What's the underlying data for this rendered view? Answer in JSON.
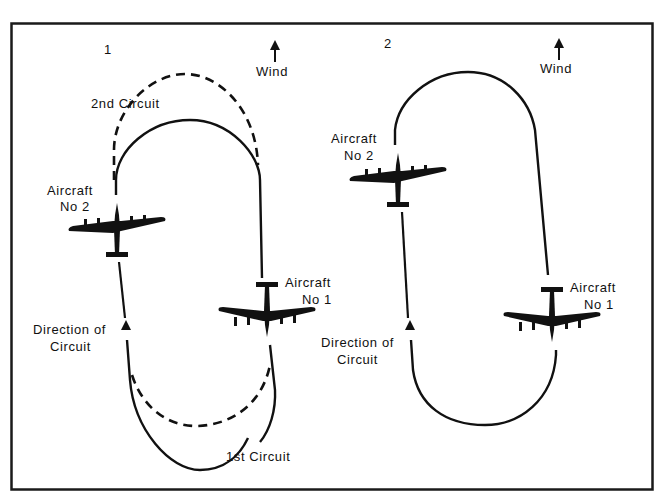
{
  "figure": {
    "border_color": "#1a1a1a",
    "ink_color": "#111111",
    "background": "#ffffff"
  },
  "panels": [
    {
      "number": "1",
      "wind_label": "Wind",
      "second_circuit_label": "2nd Circuit",
      "first_circuit_label": "1st Circuit",
      "aircraft_2": {
        "line1": "Aircraft",
        "line2": "No 2"
      },
      "aircraft_1": {
        "line1": "Aircraft",
        "line2": "No 1"
      },
      "direction": {
        "line1": "Direction of",
        "line2": "Circuit"
      }
    },
    {
      "number": "2",
      "wind_label": "Wind",
      "aircraft_2": {
        "line1": "Aircraft",
        "line2": "No 2"
      },
      "aircraft_1": {
        "line1": "Aircraft",
        "line2": "No 1"
      },
      "direction": {
        "line1": "Direction of",
        "line2": "Circuit"
      }
    }
  ]
}
